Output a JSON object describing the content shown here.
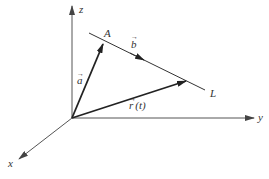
{
  "diagram": {
    "colors": {
      "background": "#ffffff",
      "axis": "#555555",
      "vector": "#222222",
      "line": "#333333",
      "text": "#333333"
    },
    "origin": [
      72,
      118
    ],
    "axes": {
      "x": {
        "label": "x",
        "end": [
          18,
          160
        ]
      },
      "y": {
        "label": "y",
        "end": [
          254,
          118
        ]
      },
      "z": {
        "label": "z",
        "end": [
          72,
          5
        ]
      }
    },
    "point_A": {
      "label": "A",
      "pos": [
        103,
        43
      ]
    },
    "line": {
      "label": "L",
      "start": [
        89,
        33
      ],
      "end": [
        205,
        90
      ]
    },
    "vectors": {
      "a": {
        "label": "a",
        "arrow": "→",
        "from": [
          72,
          118
        ],
        "to": [
          103,
          43
        ]
      },
      "b": {
        "label": "b",
        "arrow": "→",
        "direction_marker": [
          143,
          59
        ]
      },
      "r": {
        "label": "r",
        "arrow": "→",
        "param": "(t)",
        "from": [
          72,
          118
        ],
        "to": [
          186,
          81
        ]
      }
    }
  }
}
